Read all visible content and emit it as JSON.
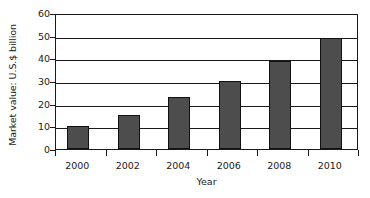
{
  "chart_data": {
    "type": "bar",
    "title": "",
    "xlabel": "Year",
    "ylabel": "Market value: U.S.$ billion",
    "categories": [
      "2000",
      "2002",
      "2004",
      "2006",
      "2008",
      "2010"
    ],
    "values": [
      10,
      15,
      23,
      30,
      39,
      49
    ],
    "series": [
      {
        "name": "Market value",
        "values": [
          10,
          15,
          23,
          30,
          39,
          49
        ]
      }
    ],
    "ylim": [
      0,
      60
    ],
    "yticks": [
      0,
      10,
      20,
      30,
      40,
      50,
      60
    ],
    "ytick_labels": [
      "0",
      "10",
      "20",
      "30",
      "40",
      "50",
      "60"
    ],
    "grid": true,
    "grid_axis": "y",
    "legend": false,
    "legend_position": "none",
    "bar_color": "#4d4d4d",
    "bar_edge_color": "#111111",
    "axis_color": "#1a1a1a",
    "background_color": "#ffffff"
  }
}
